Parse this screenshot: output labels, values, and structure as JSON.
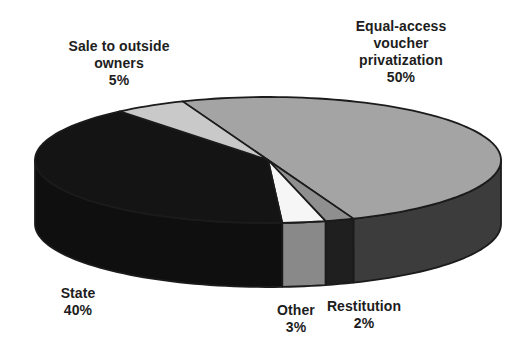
{
  "figure": {
    "background": "#ffffff"
  },
  "chart_data": {
    "type": "pie",
    "style": "3d",
    "title": "",
    "legend": "none",
    "start_angle_deg": -21.5,
    "stroke_color": "#1b1b1b",
    "slices": [
      {
        "id": "equal_access",
        "label": "Equal-access voucher privatization",
        "value": 50,
        "pct_label": "50%",
        "top_color": "#a4a4a4",
        "side_color": "#3c3c3c"
      },
      {
        "id": "restitution",
        "label": "Restitution",
        "value": 2,
        "pct_label": "2%",
        "top_color": "#8f8f8f",
        "side_color": "#1f1f1f"
      },
      {
        "id": "other",
        "label": "Other",
        "value": 3,
        "pct_label": "3%",
        "top_color": "#f6f6f6",
        "side_color": "#898989"
      },
      {
        "id": "state",
        "label": "State",
        "value": 40,
        "pct_label": "40%",
        "top_color": "#141414",
        "side_color": "#0f0f0f"
      },
      {
        "id": "sale_outside",
        "label": "Sale to outside owners",
        "value": 5,
        "pct_label": "5%",
        "top_color": "#c9c9c9",
        "side_color": "#9c9c9c"
      }
    ]
  },
  "labels": {
    "equal": {
      "line1": "Equal-access",
      "line2": "voucher",
      "line3": "privatization",
      "pct": "50%"
    },
    "sale": {
      "line1": "Sale to outside",
      "line2": "owners",
      "pct": "5%"
    },
    "state": {
      "line1": "State",
      "pct": "40%"
    },
    "other": {
      "line1": "Other",
      "pct": "3%"
    },
    "restitution": {
      "line1": "Restitution",
      "pct": "2%"
    }
  }
}
